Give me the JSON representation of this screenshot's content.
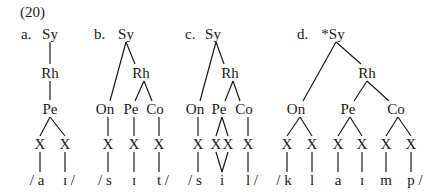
{
  "example_number": "(20)",
  "trees": [
    {
      "label": "a.",
      "root": "Sy",
      "rhyme": "Rh",
      "peak": "Pe",
      "x_slots": [
        "X",
        "X"
      ],
      "segments": [
        "/ a",
        "ɪ /"
      ]
    },
    {
      "label": "b.",
      "root": "Sy",
      "onset": "On",
      "rhyme": "Rh",
      "peak": "Pe",
      "coda": "Co",
      "x_slots": [
        "X",
        "X",
        "X"
      ],
      "segments": [
        "/ s",
        "ɪ",
        "t /"
      ]
    },
    {
      "label": "c.",
      "root": "Sy",
      "onset": "On",
      "rhyme": "Rh",
      "peak": "Pe",
      "coda": "Co",
      "x_slots": [
        "X",
        "X",
        "X",
        "X"
      ],
      "segments": [
        "/ s",
        "i",
        "l /"
      ]
    },
    {
      "label": "d.",
      "root": "*Sy",
      "onset": "On",
      "rhyme": "Rh",
      "peak": "Pe",
      "coda": "Co",
      "x_slots": [
        "X",
        "X",
        "X",
        "X",
        "X",
        "X"
      ],
      "segments": [
        "/ k",
        "l",
        "a",
        "ɪ",
        "m",
        "p /"
      ]
    }
  ]
}
